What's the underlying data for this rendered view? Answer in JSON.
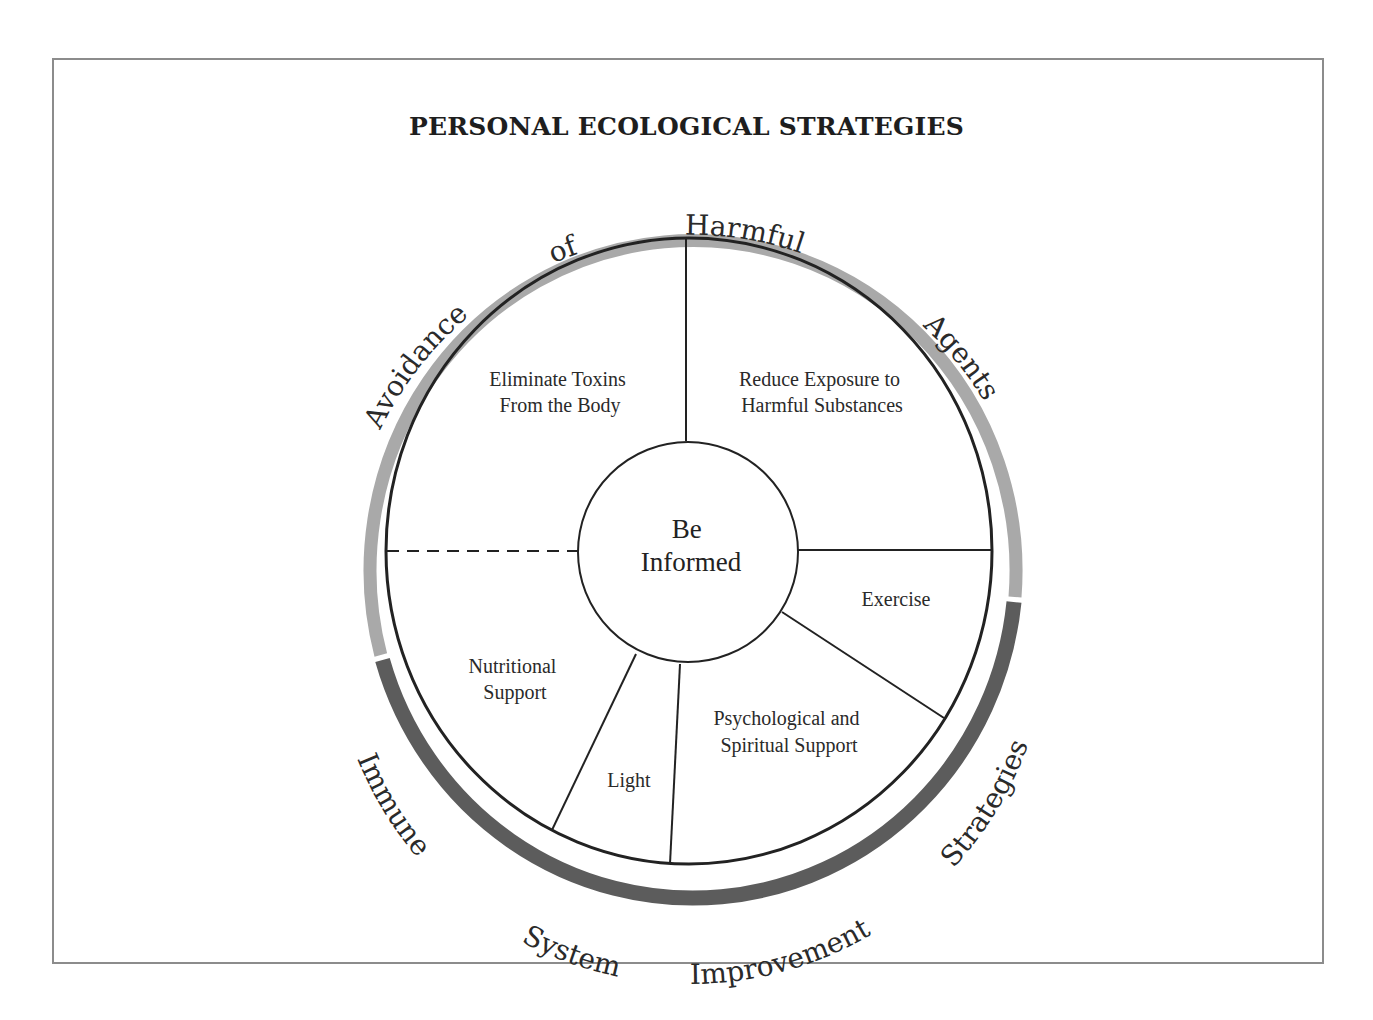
{
  "title": "PERSONAL ECOLOGICAL STRATEGIES",
  "center": {
    "lines": [
      "Be",
      "Informed"
    ]
  },
  "segments": [
    {
      "name": "eliminate-toxins",
      "lines": [
        "Eliminate Toxins",
        "From the Body"
      ]
    },
    {
      "name": "reduce-exposure",
      "lines": [
        "Reduce Exposure to",
        "Harmful Substances"
      ]
    },
    {
      "name": "exercise",
      "lines": [
        "Exercise"
      ]
    },
    {
      "name": "psychological-spiritual",
      "lines": [
        "Psychological and",
        "Spiritual Support"
      ]
    },
    {
      "name": "light",
      "lines": [
        "Light"
      ]
    },
    {
      "name": "nutritional-support",
      "lines": [
        "Nutritional",
        "Support"
      ]
    }
  ],
  "outer_groups": [
    {
      "name": "avoidance",
      "label_words": [
        "Avoidance",
        "of",
        "Harmful",
        "Agents"
      ],
      "color": "#a9a9a9"
    },
    {
      "name": "immune",
      "label_words": [
        "Immune",
        "System",
        "Improvement",
        "Strategies"
      ],
      "color": "#5c5c5c"
    }
  ],
  "colors": {
    "frame": "#8c8c8c",
    "lines": "#222222",
    "text": "#2a2a2a"
  }
}
